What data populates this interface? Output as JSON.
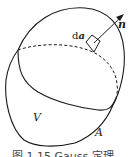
{
  "figure": {
    "caption": "图 1.15  Gauss 定理",
    "labels": {
      "area_element_prefix": "d",
      "area_element_symbol": "a",
      "normal_vector": "n",
      "volume": "V",
      "surface": "A"
    },
    "colors": {
      "stroke": "#1a1a1a",
      "background": "#ffffff"
    }
  }
}
